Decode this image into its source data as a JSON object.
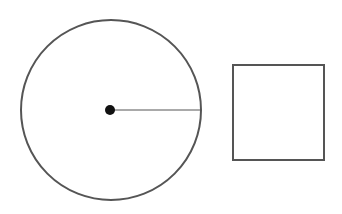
{
  "diagram": {
    "background": "#ffffff",
    "stroke_color": "#555555",
    "circle": {
      "cx": 111,
      "cy": 110,
      "r": 90,
      "stroke_width": 2
    },
    "center_dot": {
      "cx": 110,
      "cy": 110,
      "r": 5,
      "fill": "#111111"
    },
    "radius_line": {
      "x1": 110,
      "y1": 110,
      "x2": 201,
      "y2": 110,
      "stroke_width": 1
    },
    "square": {
      "x": 233,
      "y": 65,
      "width": 91,
      "height": 95,
      "stroke_width": 2
    }
  }
}
